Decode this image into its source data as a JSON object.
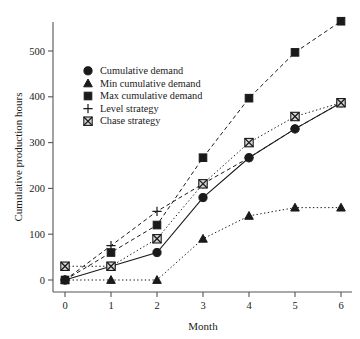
{
  "chart_data": {
    "type": "line",
    "title": "",
    "xlabel": "Month",
    "ylabel": "Cumulative production hours",
    "x": [
      0,
      1,
      2,
      3,
      4,
      5,
      6
    ],
    "xticklabels": [
      "0",
      "1",
      "2",
      "3",
      "4",
      "5",
      "6"
    ],
    "yticks": [
      0,
      100,
      200,
      300,
      400,
      500
    ],
    "yticklabels": [
      "0",
      "100",
      "200",
      "300",
      "400",
      "500"
    ],
    "xlim": [
      -0.35,
      6.35
    ],
    "ylim": [
      -25,
      600
    ],
    "grid": false,
    "legend_position": "upper-left-inside",
    "series": [
      {
        "name": "Cumulative demand",
        "marker": "circle",
        "linestyle": "solid",
        "values": [
          0,
          30,
          60,
          180,
          267,
          330,
          387
        ]
      },
      {
        "name": "Min cumulative demand",
        "marker": "triangle",
        "linestyle": "dotted",
        "values": [
          0,
          0,
          0,
          90,
          140,
          158,
          158
        ]
      },
      {
        "name": "Max cumulative demand",
        "marker": "square",
        "linestyle": "dashed",
        "values": [
          0,
          60,
          120,
          267,
          397,
          497,
          565
        ]
      },
      {
        "name": "Level strategy",
        "marker": "plus",
        "linestyle": "dashed",
        "values": [
          0,
          75,
          150,
          210,
          267,
          330,
          387
        ]
      },
      {
        "name": "Chase strategy",
        "marker": "crossed-square",
        "linestyle": "dotted",
        "values": [
          30,
          30,
          90,
          210,
          300,
          357,
          387
        ]
      }
    ]
  },
  "legend": {
    "items": [
      {
        "label": "Cumulative demand",
        "marker_name": "circle-marker-icon"
      },
      {
        "label": "Min cumulative demand",
        "marker_name": "triangle-marker-icon"
      },
      {
        "label": "Max cumulative demand",
        "marker_name": "square-marker-icon"
      },
      {
        "label": "Level strategy",
        "marker_name": "plus-marker-icon"
      },
      {
        "label": "Chase strategy",
        "marker_name": "crossed-square-marker-icon"
      }
    ]
  },
  "axes": {
    "x_title": "Month",
    "y_title": "Cumulative production hours"
  }
}
